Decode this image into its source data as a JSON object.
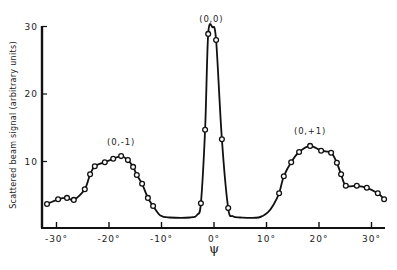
{
  "chart_data": {
    "type": "line",
    "title": "",
    "xlabel": "ψ",
    "ylabel": "Scattered beam signal  (arbitrary units)",
    "xlim": [
      -33,
      33
    ],
    "ylim": [
      0,
      30
    ],
    "grid": false,
    "legend": null,
    "x_ticks": [
      -30,
      -20,
      -10,
      0,
      10,
      20,
      30
    ],
    "x_tick_labels": [
      "-30°",
      "-20°",
      "-10°",
      "0°",
      "10°",
      "20°",
      "30°"
    ],
    "y_ticks": [
      10,
      20,
      30
    ],
    "y_tick_labels": [
      "10",
      "20",
      "30"
    ],
    "annotations": [
      {
        "text": "(0,-1)",
        "x": -17.7,
        "y": 12.8
      },
      {
        "text": "(0,0)",
        "x": -0.5,
        "y": 31.0
      },
      {
        "text": "(0,+1)",
        "x": 18.3,
        "y": 14.3
      }
    ],
    "series": [
      {
        "name": "measured points",
        "marker": "open-circle",
        "x": [
          -31.8,
          -29.7,
          -28.0,
          -26.7,
          -24.6,
          -23.6,
          -22.7,
          -20.8,
          -19.2,
          -17.7,
          -16.4,
          -15.4,
          -14.7,
          -13.7,
          -12.6,
          -11.6,
          -2.5,
          -1.7,
          -1.1,
          0.4,
          1.5,
          2.7,
          12.4,
          13.3,
          14.7,
          16.2,
          18.3,
          20.4,
          22.3,
          23.4,
          24.2,
          25.1,
          27.2,
          29.1,
          31.2,
          32.4
        ],
        "y": [
          4.0,
          4.7,
          4.9,
          4.6,
          6.2,
          8.4,
          9.6,
          10.2,
          10.7,
          11.1,
          10.5,
          9.5,
          8.3,
          7.0,
          4.9,
          3.7,
          4.1,
          15.0,
          29.2,
          28.3,
          13.6,
          3.4,
          5.6,
          8.1,
          10.2,
          11.7,
          12.6,
          11.9,
          11.6,
          10.1,
          8.4,
          6.7,
          6.7,
          6.4,
          5.6,
          4.7
        ]
      }
    ],
    "trough_level": 2.0
  }
}
